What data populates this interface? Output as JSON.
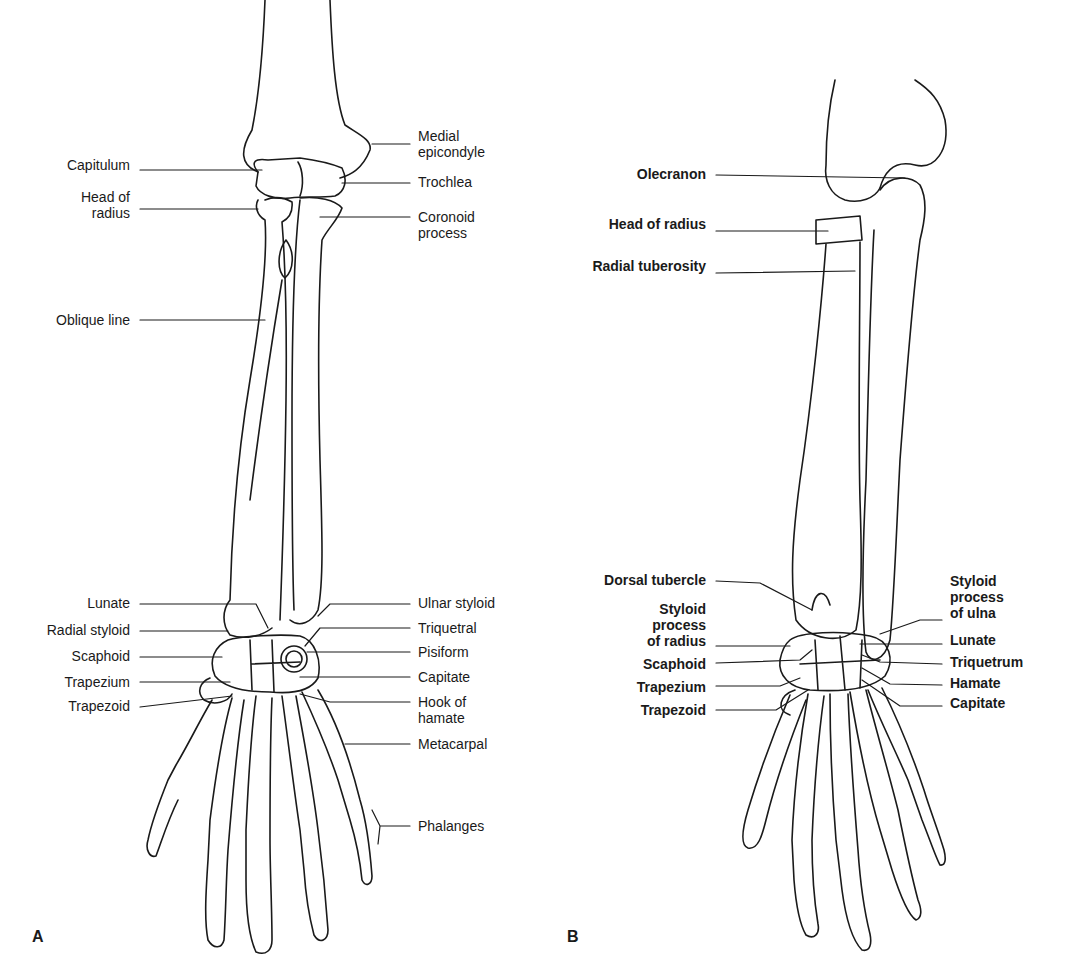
{
  "panels": {
    "a": {
      "tag": "A",
      "left_labels": [
        {
          "text": "Capitulum",
          "x": 130,
          "y": 162
        },
        {
          "text": "Head of\nradius",
          "x": 130,
          "y": 190
        },
        {
          "text": "Oblique line",
          "x": 130,
          "y": 312
        },
        {
          "text": "Lunate",
          "x": 130,
          "y": 595
        },
        {
          "text": "Radial styloid",
          "x": 130,
          "y": 622
        },
        {
          "text": "Scaphoid",
          "x": 130,
          "y": 648
        },
        {
          "text": "Trapezium",
          "x": 130,
          "y": 674
        },
        {
          "text": "Trapezoid",
          "x": 130,
          "y": 698
        }
      ],
      "right_labels": [
        {
          "text": "Medial\nepicondyle",
          "x": 418,
          "y": 128
        },
        {
          "text": "Trochlea",
          "x": 418,
          "y": 174
        },
        {
          "text": "Coronoid\nprocess",
          "x": 418,
          "y": 209
        },
        {
          "text": "Ulnar styloid",
          "x": 418,
          "y": 595
        },
        {
          "text": "Triquetral",
          "x": 418,
          "y": 620
        },
        {
          "text": "Pisiform",
          "x": 418,
          "y": 644
        },
        {
          "text": "Capitate",
          "x": 418,
          "y": 669
        },
        {
          "text": "Hook of\nhamate",
          "x": 418,
          "y": 694
        },
        {
          "text": "Metacarpal",
          "x": 418,
          "y": 736
        },
        {
          "text": "Phalanges",
          "x": 418,
          "y": 818
        }
      ]
    },
    "b": {
      "tag": "B",
      "left_labels": [
        {
          "text": "Olecranon",
          "x": 706,
          "y": 166
        },
        {
          "text": "Head of radius",
          "x": 706,
          "y": 216
        },
        {
          "text": "Radial tuberosity",
          "x": 706,
          "y": 258
        },
        {
          "text": "Dorsal tubercle",
          "x": 706,
          "y": 572
        },
        {
          "text": "Styloid\nprocess\nof radius",
          "x": 706,
          "y": 601
        },
        {
          "text": "Scaphoid",
          "x": 706,
          "y": 656
        },
        {
          "text": "Trapezium",
          "x": 706,
          "y": 679
        },
        {
          "text": "Trapezoid",
          "x": 706,
          "y": 702
        }
      ],
      "right_labels": [
        {
          "text": "Styloid\nprocess\nof ulna",
          "x": 950,
          "y": 573
        },
        {
          "text": "Lunate",
          "x": 950,
          "y": 632
        },
        {
          "text": "Triquetrum",
          "x": 950,
          "y": 654
        },
        {
          "text": "Hamate",
          "x": 950,
          "y": 675
        },
        {
          "text": "Capitate",
          "x": 950,
          "y": 695
        }
      ]
    }
  }
}
